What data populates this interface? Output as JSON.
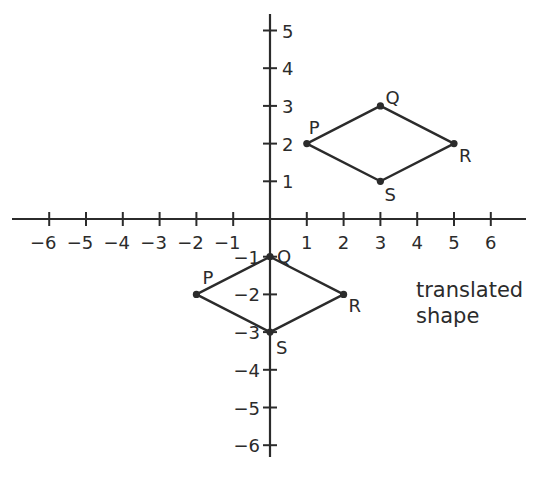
{
  "diagram": {
    "axes": {
      "x_ticks": [
        -6,
        -5,
        -4,
        -3,
        -2,
        -1,
        1,
        2,
        3,
        4,
        5,
        6
      ],
      "x_tick_labels": [
        "−6",
        "−5",
        "−4",
        "−3",
        "−2",
        "−1",
        "1",
        "2",
        "3",
        "4",
        "5",
        "6"
      ],
      "y_ticks": [
        5,
        4,
        3,
        2,
        1,
        -1,
        -2,
        -3,
        -4,
        -5,
        -6
      ],
      "y_tick_labels": [
        "5",
        "4",
        "3",
        "2",
        "1",
        "−1",
        "−2",
        "−3",
        "−4",
        "−5",
        "−6"
      ],
      "color": "#2b2b2b"
    },
    "original_shape": {
      "vertices": [
        {
          "label": "P",
          "x": 1,
          "y": 2
        },
        {
          "label": "Q",
          "x": 3,
          "y": 3
        },
        {
          "label": "R",
          "x": 5,
          "y": 2
        },
        {
          "label": "S",
          "x": 3,
          "y": 1
        }
      ]
    },
    "translated_shape": {
      "caption_line1": "translated",
      "caption_line2": "shape",
      "vertices": [
        {
          "label": "P",
          "x": -2,
          "y": -2
        },
        {
          "label": "Q",
          "x": 0,
          "y": -1
        },
        {
          "label": "R",
          "x": 2,
          "y": -2
        },
        {
          "label": "S",
          "x": 0,
          "y": -3
        }
      ]
    }
  }
}
